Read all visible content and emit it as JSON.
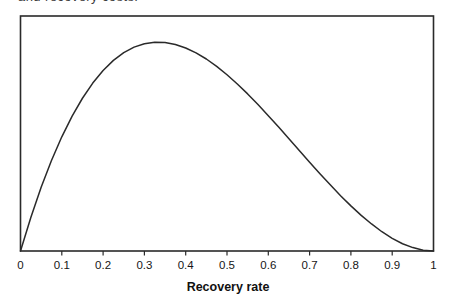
{
  "top_caption_fragment": "and recovery costs.",
  "colors": {
    "line": "#2a2a2a",
    "frame": "#2a2a2a",
    "text": "#161616"
  },
  "chart_data": {
    "type": "line",
    "title": "",
    "xlabel": "Recovery rate",
    "ylabel": "",
    "xlim": [
      0,
      1
    ],
    "ylim": [
      0,
      2
    ],
    "grid": false,
    "legend": false,
    "x_ticks": [
      0,
      0.1,
      0.2,
      0.3,
      0.4,
      0.5,
      0.6,
      0.7,
      0.8,
      0.9,
      1
    ],
    "x_tick_labels": [
      "0",
      "0.1",
      "0.2",
      "0.3",
      "0.4",
      "0.5",
      "0.6",
      "0.7",
      "0.8",
      "0.9",
      "1"
    ],
    "series": [
      {
        "name": "recovery-rate-probability-density",
        "mode_x": 0.33,
        "peak_y": 1.78,
        "x": [
          0,
          0.025,
          0.05,
          0.075,
          0.1,
          0.125,
          0.15,
          0.175,
          0.2,
          0.225,
          0.25,
          0.275,
          0.3,
          0.325,
          0.35,
          0.375,
          0.4,
          0.425,
          0.45,
          0.475,
          0.5,
          0.525,
          0.55,
          0.575,
          0.6,
          0.625,
          0.65,
          0.675,
          0.7,
          0.725,
          0.75,
          0.775,
          0.8,
          0.825,
          0.85,
          0.875,
          0.9,
          0.925,
          0.95,
          0.975,
          1
        ],
        "y": [
          0,
          0.285,
          0.542,
          0.77,
          0.972,
          1.148,
          1.3,
          1.429,
          1.536,
          1.622,
          1.688,
          1.735,
          1.764,
          1.777,
          1.775,
          1.758,
          1.728,
          1.686,
          1.634,
          1.571,
          1.5,
          1.421,
          1.337,
          1.246,
          1.152,
          1.055,
          0.956,
          0.856,
          0.756,
          0.658,
          0.563,
          0.471,
          0.384,
          0.303,
          0.23,
          0.164,
          0.108,
          0.062,
          0.029,
          0.007,
          0
        ]
      }
    ]
  }
}
